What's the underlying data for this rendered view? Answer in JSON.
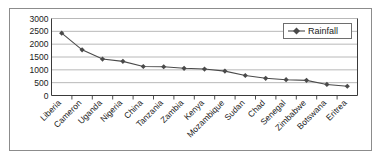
{
  "chart_data": {
    "type": "line",
    "title": "",
    "xlabel": "",
    "ylabel": "",
    "ylim": [
      0,
      3000
    ],
    "ytick_values": [
      0,
      500,
      1000,
      1500,
      2000,
      2500,
      3000
    ],
    "ytick_labels": [
      "0",
      "500",
      "1000",
      "1500",
      "2000",
      "2500",
      "3000"
    ],
    "grid": true,
    "grid_axis": "y",
    "legend_position": "upper right",
    "categories": [
      "Liberia",
      "Cameron",
      "Uganda",
      "Nigeria",
      "China",
      "Tanzania",
      "Zambia",
      "Kenya",
      "Mozambique",
      "Sudan",
      "Chad",
      "Senegal",
      "Zimbabwe",
      "Botswana",
      "Eritrea"
    ],
    "series": [
      {
        "name": "Rainfall",
        "marker": "diamond",
        "color": "#4a4a4a",
        "values": [
          2430,
          1780,
          1420,
          1330,
          1130,
          1120,
          1060,
          1030,
          950,
          780,
          670,
          615,
          590,
          430,
          360
        ]
      }
    ]
  },
  "legend": {
    "entries": [
      {
        "label": "Rainfall",
        "marker": "diamond-marker-icon",
        "color": "#4a4a4a"
      }
    ]
  },
  "axes": {
    "y_axis_name": "y-axis",
    "x_axis_name": "x-axis"
  },
  "colors": {
    "frame": "#8c8c8c",
    "axis": "#3a3a3a",
    "gridline": "#b0b0b0",
    "series": "#4a4a4a",
    "text": "#1a1a1a",
    "background": "#ffffff"
  }
}
